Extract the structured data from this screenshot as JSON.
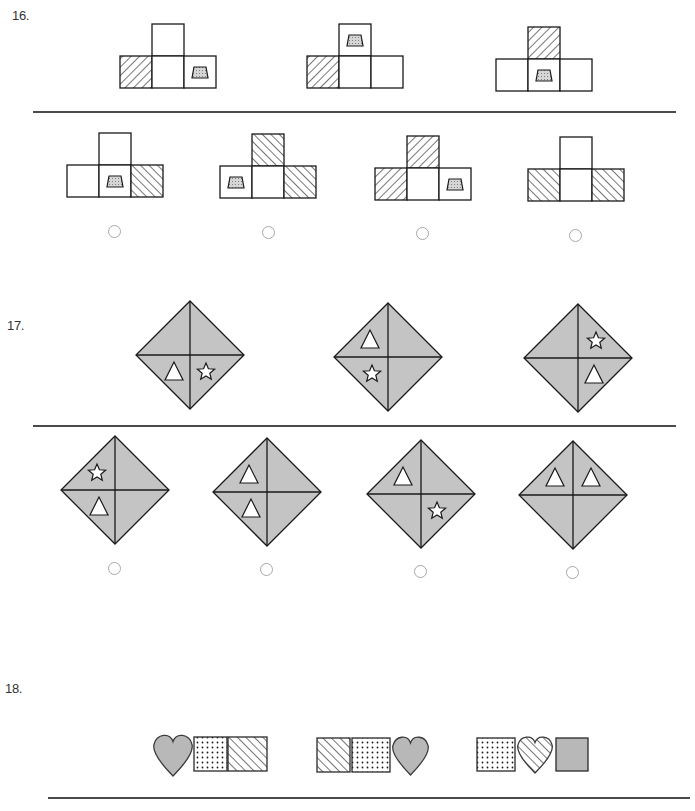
{
  "colors": {
    "stroke": "#1a1a1a",
    "gray_fill": "#b8b8b8",
    "diamond_fill": "#c4c4c4",
    "radio_border": "#a8a8a8",
    "divider": "#4a4a4a"
  },
  "questions": [
    {
      "number": "16.",
      "label_pos": [
        12,
        8
      ],
      "cell_size": 32,
      "divider": {
        "x1": 33,
        "x2": 676,
        "y": 111
      },
      "prompt_figures": [
        {
          "x": 120,
          "y": 24,
          "cells": {
            "top": "blank",
            "left": "hatch-back",
            "center": "blank",
            "right": "trapezoid"
          }
        },
        {
          "x": 307,
          "y": 24,
          "cells": {
            "top": "trapezoid",
            "left": "hatch-back",
            "center": "blank",
            "right": "blank"
          }
        },
        {
          "x": 496,
          "y": 27,
          "cells": {
            "top": "hatch-back",
            "left": "blank",
            "center": "trapezoid",
            "right": "blank"
          }
        }
      ],
      "options": [
        {
          "x": 67,
          "y": 133,
          "cells": {
            "top": "blank",
            "left": "blank",
            "center": "trapezoid",
            "right": "hatch-fwd"
          },
          "radio": [
            114,
            231
          ]
        },
        {
          "x": 220,
          "y": 134,
          "cells": {
            "top": "hatch-fwd",
            "left": "trapezoid",
            "center": "blank",
            "right": "hatch-fwd"
          },
          "radio": [
            268,
            232
          ]
        },
        {
          "x": 375,
          "y": 136,
          "cells": {
            "top": "hatch-back",
            "left": "hatch-back",
            "center": "blank",
            "right": "trapezoid"
          },
          "radio": [
            422,
            233
          ]
        },
        {
          "x": 528,
          "y": 137,
          "cells": {
            "top": "blank",
            "left": "hatch-fwd",
            "center": "blank",
            "right": "hatch-fwd"
          },
          "radio": [
            575,
            235
          ]
        }
      ]
    },
    {
      "number": "17.",
      "label_pos": [
        7,
        318
      ],
      "divider": {
        "x1": 33,
        "x2": 676,
        "y": 425
      },
      "half": 54,
      "prompt_figures": [
        {
          "cx": 190,
          "cy": 355,
          "quadrants": {
            "top": "",
            "left": "",
            "bottom-left": "triangle",
            "bottom-right": "star"
          }
        },
        {
          "cx": 388,
          "cy": 357,
          "quadrants": {
            "top-left": "triangle",
            "bottom-left": "star"
          }
        },
        {
          "cx": 578,
          "cy": 358,
          "quadrants": {
            "top-right": "star",
            "bottom-right": "triangle"
          }
        }
      ],
      "options": [
        {
          "cx": 115,
          "cy": 490,
          "quadrants": {
            "top-left": "star",
            "bottom-left": "triangle"
          },
          "radio": [
            114,
            568
          ]
        },
        {
          "cx": 267,
          "cy": 492,
          "quadrants": {
            "top-left": "triangle",
            "bottom-left": "triangle"
          },
          "radio": [
            266,
            569
          ]
        },
        {
          "cx": 421,
          "cy": 494,
          "quadrants": {
            "top-left": "triangle",
            "bottom-right": "star"
          },
          "radio": [
            420,
            571
          ]
        },
        {
          "cx": 573,
          "cy": 495,
          "quadrants": {
            "top-left": "triangle",
            "top-right": "triangle"
          },
          "radio": [
            572,
            572
          ]
        }
      ]
    },
    {
      "number": "18.",
      "label_pos": [
        5,
        681
      ],
      "divider": {
        "x1": 48,
        "x2": 690,
        "y": 797
      },
      "prompt_figures": [
        {
          "items": [
            {
              "shape": "heart",
              "fill": "gray",
              "x": 153,
              "y": 733,
              "w": 40,
              "h": 43
            },
            {
              "shape": "square",
              "fill": "dots",
              "x": 194,
              "y": 737,
              "w": 33,
              "h": 34
            },
            {
              "shape": "square",
              "fill": "hatch-fwd",
              "x": 228,
              "y": 737,
              "w": 39,
              "h": 34
            }
          ]
        },
        {
          "items": [
            {
              "shape": "square",
              "fill": "hatch-fwd",
              "x": 317,
              "y": 738,
              "w": 33,
              "h": 34
            },
            {
              "shape": "square",
              "fill": "dots",
              "x": 352,
              "y": 738,
              "w": 38,
              "h": 34
            },
            {
              "shape": "heart",
              "fill": "gray",
              "x": 392,
              "y": 735,
              "w": 37,
              "h": 40
            }
          ]
        },
        {
          "items": [
            {
              "shape": "square",
              "fill": "dots",
              "x": 477,
              "y": 738,
              "w": 38,
              "h": 33
            },
            {
              "shape": "heart",
              "fill": "hatch-fwd",
              "x": 517,
              "y": 735,
              "w": 36,
              "h": 38
            },
            {
              "shape": "square",
              "fill": "gray",
              "x": 556,
              "y": 738,
              "w": 32,
              "h": 33
            }
          ]
        }
      ]
    }
  ]
}
